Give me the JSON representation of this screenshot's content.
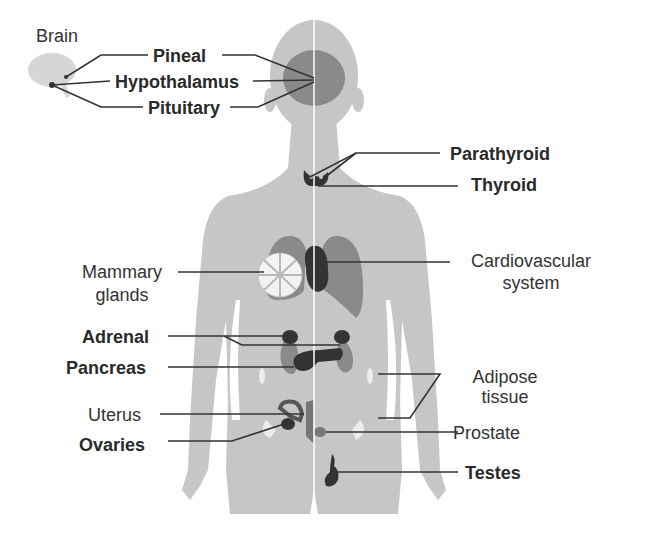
{
  "figure": {
    "colors": {
      "body": "#c4c4c4",
      "organ_mid": "#8a8a8a",
      "organ_dark": "#3a3a3a",
      "line": "#333333",
      "midline": "#ffffff"
    },
    "brain_label": "Brain",
    "labels_left": [
      {
        "text": "Pineal",
        "bold": true
      },
      {
        "text": "Hypothalamus",
        "bold": true
      },
      {
        "text": "Pituitary",
        "bold": true
      },
      {
        "text": "Mammary",
        "bold": false
      },
      {
        "text": "glands",
        "bold": false
      },
      {
        "text": "Adrenal",
        "bold": true
      },
      {
        "text": "Pancreas",
        "bold": true
      },
      {
        "text": "Uterus",
        "bold": false
      },
      {
        "text": "Ovaries",
        "bold": true
      }
    ],
    "labels_right": [
      {
        "text": "Parathyroid",
        "bold": true
      },
      {
        "text": "Thyroid",
        "bold": true
      },
      {
        "text": "Cardiovascular",
        "bold": false
      },
      {
        "text": "system",
        "bold": false
      },
      {
        "text": "Adipose",
        "bold": false
      },
      {
        "text": "tissue",
        "bold": false
      },
      {
        "text": "Prostate",
        "bold": false
      },
      {
        "text": "Testes",
        "bold": true
      }
    ]
  }
}
